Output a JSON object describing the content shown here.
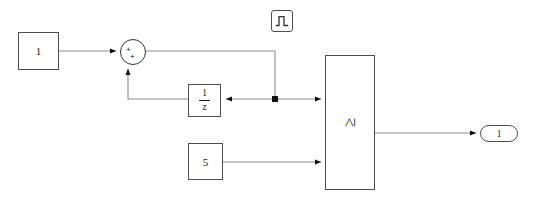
{
  "diagram": {
    "background_color": "#ffffff",
    "wire_color": "#808080",
    "border_color": "#4d4d4d",
    "text_color": "#1a1a1a",
    "width": 534,
    "height": 204
  },
  "blocks": {
    "constant_one": {
      "label": "1",
      "name": "Constant",
      "type": "constant"
    },
    "sum": {
      "name": "Sum",
      "type": "sum",
      "sign_input_1": "+",
      "sign_input_2": "+"
    },
    "unit_delay": {
      "numerator": "1",
      "denominator": "z",
      "name": "Unit Delay",
      "type": "unit-delay"
    },
    "pulse_generator": {
      "name": "Pulse Generator",
      "type": "pulse-generator",
      "icon": "square-pulse-icon"
    },
    "constant_five": {
      "label": "5",
      "name": "Constant1",
      "type": "constant"
    },
    "relational_operator": {
      "operator": "≥",
      "name": "Relational Operator",
      "type": "relational-operator"
    },
    "output_port": {
      "label": "1",
      "name": "Out1",
      "type": "outport"
    }
  },
  "signals": {
    "junction": {
      "name": "branch-point",
      "type": "junction-dot"
    }
  }
}
